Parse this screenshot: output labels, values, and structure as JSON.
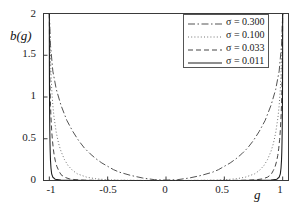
{
  "chart_data": {
    "type": "line",
    "title": "",
    "xlabel": "g",
    "ylabel": "b(g)",
    "xlim": [
      -1.05,
      1.05
    ],
    "ylim": [
      0,
      2
    ],
    "xticks": [
      -1,
      -0.5,
      0,
      0.5,
      1
    ],
    "xticklabels": [
      "-1",
      "-0.5",
      "0",
      "0.5",
      "1"
    ],
    "yticks": [
      0,
      0.5,
      1,
      1.5,
      2
    ],
    "yticklabels": [
      "0",
      "0.5",
      "1",
      "1.5",
      "2"
    ],
    "grid": false,
    "legend_position": "upper right",
    "series": [
      {
        "name": "σ = 0.300",
        "sigma": 0.3,
        "linestyle": "dashdot",
        "color": "#4a4a4a",
        "x": [
          -1.0,
          -0.99,
          -0.97,
          -0.94,
          -0.9,
          -0.85,
          -0.8,
          -0.75,
          -0.7,
          -0.65,
          -0.6,
          -0.55,
          -0.5,
          -0.45,
          -0.4,
          -0.3,
          -0.2,
          -0.1,
          0.0,
          0.1,
          0.2,
          0.3,
          0.4,
          0.45,
          0.5,
          0.55,
          0.6,
          0.65,
          0.7,
          0.75,
          0.8,
          0.85,
          0.9,
          0.94,
          0.97,
          0.99,
          1.0
        ],
        "y": [
          2.0,
          1.62,
          1.31,
          1.09,
          0.9,
          0.72,
          0.59,
          0.48,
          0.39,
          0.32,
          0.26,
          0.21,
          0.17,
          0.13,
          0.1,
          0.06,
          0.03,
          0.01,
          0.005,
          0.01,
          0.03,
          0.06,
          0.1,
          0.13,
          0.17,
          0.21,
          0.26,
          0.32,
          0.39,
          0.48,
          0.59,
          0.72,
          0.9,
          1.09,
          1.31,
          1.62,
          2.0
        ]
      },
      {
        "name": "σ = 0.100",
        "sigma": 0.1,
        "linestyle": "dotted",
        "color": "#6a6a6a",
        "x": [
          -1.0,
          -0.995,
          -0.99,
          -0.985,
          -0.98,
          -0.97,
          -0.96,
          -0.94,
          -0.92,
          -0.9,
          -0.87,
          -0.84,
          -0.8,
          -0.76,
          -0.72,
          -0.68,
          -0.6,
          -0.5,
          -0.4,
          -0.2,
          0.0,
          0.2,
          0.4,
          0.5,
          0.6,
          0.68,
          0.72,
          0.76,
          0.8,
          0.84,
          0.87,
          0.9,
          0.92,
          0.94,
          0.96,
          0.97,
          0.98,
          0.985,
          0.99,
          0.995,
          1.0
        ],
        "y": [
          2.0,
          1.72,
          1.45,
          1.26,
          1.1,
          0.9,
          0.76,
          0.57,
          0.44,
          0.35,
          0.25,
          0.18,
          0.12,
          0.08,
          0.06,
          0.04,
          0.02,
          0.008,
          0.004,
          0.001,
          0.0005,
          0.001,
          0.004,
          0.008,
          0.02,
          0.04,
          0.06,
          0.08,
          0.12,
          0.18,
          0.25,
          0.35,
          0.44,
          0.57,
          0.76,
          0.9,
          1.1,
          1.26,
          1.45,
          1.72,
          2.0
        ]
      },
      {
        "name": "σ = 0.033",
        "sigma": 0.033,
        "linestyle": "dashed",
        "color": "#3c3c3c",
        "x": [
          -1.0,
          -0.999,
          -0.998,
          -0.996,
          -0.994,
          -0.99,
          -0.986,
          -0.98,
          -0.974,
          -0.966,
          -0.958,
          -0.948,
          -0.936,
          -0.92,
          -0.9,
          -0.87,
          -0.83,
          -0.78,
          -0.7,
          -0.6,
          -0.4,
          -0.2,
          0.0,
          0.2,
          0.4,
          0.6,
          0.7,
          0.78,
          0.83,
          0.87,
          0.9,
          0.92,
          0.936,
          0.948,
          0.958,
          0.966,
          0.974,
          0.98,
          0.986,
          0.99,
          0.994,
          0.996,
          0.998,
          0.999,
          1.0
        ],
        "y": [
          2.0,
          1.76,
          1.55,
          1.3,
          1.13,
          0.9,
          0.76,
          0.6,
          0.49,
          0.38,
          0.3,
          0.23,
          0.17,
          0.12,
          0.07,
          0.04,
          0.02,
          0.01,
          0.004,
          0.002,
          0.0008,
          0.0004,
          0.0002,
          0.0004,
          0.0008,
          0.002,
          0.004,
          0.01,
          0.02,
          0.04,
          0.07,
          0.12,
          0.17,
          0.23,
          0.3,
          0.38,
          0.49,
          0.6,
          0.76,
          0.9,
          1.13,
          1.3,
          1.55,
          1.76,
          2.0
        ]
      },
      {
        "name": "σ = 0.011",
        "sigma": 0.011,
        "linestyle": "solid",
        "color": "#1f1f1f",
        "x": [
          -1.0,
          -0.9999,
          -0.9997,
          -0.9994,
          -0.999,
          -0.9985,
          -0.9978,
          -0.997,
          -0.996,
          -0.9945,
          -0.9925,
          -0.99,
          -0.986,
          -0.98,
          -0.97,
          -0.95,
          -0.9,
          -0.8,
          -0.6,
          -0.3,
          0.0,
          0.3,
          0.6,
          0.8,
          0.9,
          0.95,
          0.97,
          0.98,
          0.986,
          0.99,
          0.9925,
          0.9945,
          0.996,
          0.997,
          0.9978,
          0.9985,
          0.999,
          0.9994,
          0.9997,
          0.9999,
          1.0
        ],
        "y": [
          2.0,
          1.85,
          1.6,
          1.38,
          1.2,
          1.03,
          0.87,
          0.74,
          0.6,
          0.46,
          0.34,
          0.24,
          0.15,
          0.08,
          0.04,
          0.015,
          0.005,
          0.002,
          0.0008,
          0.0003,
          0.0002,
          0.0003,
          0.0008,
          0.002,
          0.005,
          0.015,
          0.04,
          0.08,
          0.15,
          0.24,
          0.34,
          0.46,
          0.6,
          0.74,
          0.87,
          1.03,
          1.2,
          1.38,
          1.6,
          1.85,
          2.0
        ]
      }
    ]
  },
  "axes": {
    "ylabel": "b(g)",
    "xlabel": "g"
  },
  "legend": {
    "entries": [
      {
        "label": "σ = 0.300"
      },
      {
        "label": "σ = 0.100"
      },
      {
        "label": "σ = 0.033"
      },
      {
        "label": "σ = 0.011"
      }
    ]
  },
  "ticks": {
    "y": [
      "2",
      "1.5",
      "1",
      "0.5",
      "0"
    ],
    "x": [
      "-1",
      "-0.5",
      "0",
      "0.5",
      "1"
    ]
  },
  "style": {
    "frame_color": "#3a3a3a",
    "background": "#ffffff",
    "text_color": "#1a1a1a"
  }
}
